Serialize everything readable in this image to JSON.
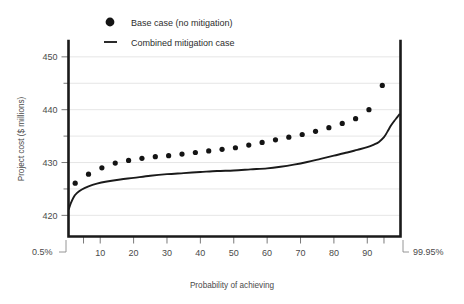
{
  "chart_data": {
    "type": "scatter",
    "title": "",
    "xlabel": "Probability of achieving",
    "ylabel": "Project cost ($ millions)",
    "xlim": [
      0.5,
      99.95
    ],
    "ylim": [
      416,
      453
    ],
    "grid": true,
    "legend_position": "top-center",
    "y_ticks_major": [
      420,
      430,
      440,
      450
    ],
    "y_ticks_minor": [
      425,
      435,
      445
    ],
    "x_ticks": [
      5,
      10,
      20,
      30,
      40,
      50,
      60,
      70,
      80,
      90,
      95
    ],
    "x_tick_labels": [
      "",
      "10",
      "20",
      "30",
      "40",
      "50",
      "60",
      "70",
      "80",
      "90",
      ""
    ],
    "x_endpoint_low": "0.5%",
    "x_endpoint_high": "99.95%",
    "series": [
      {
        "name": "Base case (no mitigation)",
        "marker": "circle",
        "x": [
          2.5,
          6.5,
          10.5,
          14.5,
          18.5,
          22.5,
          26.5,
          30.5,
          34.5,
          38.5,
          42.5,
          46.5,
          50.5,
          54.5,
          58.5,
          62.5,
          66.5,
          70.5,
          74.5,
          78.5,
          82.5,
          86.5,
          90.5,
          94.5
        ],
        "values": [
          426.1,
          427.8,
          429.0,
          429.9,
          430.4,
          430.8,
          431.1,
          431.3,
          431.6,
          431.9,
          432.2,
          432.5,
          432.8,
          433.3,
          433.8,
          434.3,
          434.8,
          435.3,
          435.9,
          436.6,
          437.4,
          438.3,
          440.0,
          444.6
        ]
      },
      {
        "name": "Combined mitigation case",
        "marker": "line",
        "x": [
          0.6,
          1.2,
          2.0,
          3.0,
          4.5,
          6.5,
          9.0,
          12.0,
          16.0,
          20.0,
          25.0,
          30.0,
          35.0,
          40.0,
          45.0,
          50.0,
          55.0,
          60.0,
          64.0,
          68.0,
          72.0,
          76.0,
          80.0,
          84.0,
          87.0,
          90.0,
          92.0,
          93.5,
          95.0,
          96.0,
          97.0,
          98.0,
          99.0,
          99.6
        ],
        "values": [
          421.2,
          422.3,
          423.4,
          424.2,
          424.9,
          425.5,
          426.0,
          426.4,
          426.8,
          427.1,
          427.5,
          427.8,
          428.0,
          428.2,
          428.4,
          428.5,
          428.7,
          428.9,
          429.2,
          429.6,
          430.1,
          430.7,
          431.3,
          431.9,
          432.4,
          432.9,
          433.4,
          433.9,
          434.8,
          435.8,
          436.9,
          437.8,
          438.6,
          439.1
        ]
      }
    ]
  },
  "legend": {
    "items": [
      {
        "label": "Base case (no mitigation)",
        "marker": "circle"
      },
      {
        "label": "Combined mitigation case",
        "marker": "dash"
      }
    ]
  },
  "axes": {
    "y_title": "Project cost ($ millions)",
    "x_title": "Probability of achieving",
    "y_labels": [
      "450",
      "440",
      "430",
      "420"
    ],
    "x_labels": [
      "10",
      "20",
      "30",
      "40",
      "50",
      "60",
      "70",
      "80",
      "90"
    ],
    "x_low_label": "0.5%",
    "x_high_label": "99.95%"
  },
  "colors": {
    "dot": "#141414",
    "line": "#1a1a1a",
    "grid": "#e3e3e3",
    "axis": "#1a1a1a",
    "text": "#4a4a4a",
    "background": "#ffffff"
  }
}
